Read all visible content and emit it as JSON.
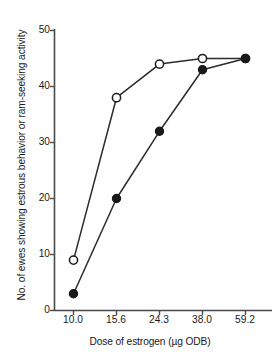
{
  "chart_data": {
    "type": "line",
    "title": "",
    "xlabel": "Dose of estrogen (µg ODB)",
    "ylabel": "No. of ewes showing estrous behavior or ram-seeking activity",
    "categories": [
      "10.0",
      "15.6",
      "24.3",
      "38.0",
      "59.2"
    ],
    "x_tick_labels": [
      "10.0",
      "15.6",
      "24.3",
      "38.0",
      "59.2"
    ],
    "y_tick_labels": [
      "0",
      "10",
      "20",
      "30",
      "40",
      "50"
    ],
    "y_ticks": [
      0,
      10,
      20,
      30,
      40,
      50
    ],
    "ylim": [
      0,
      50
    ],
    "grid": false,
    "legend": "none",
    "series": [
      {
        "name": "open-circle-series",
        "marker": "open-circle",
        "color": "#1a1a1a",
        "values": [
          9,
          38,
          44,
          45,
          45
        ]
      },
      {
        "name": "filled-circle-series",
        "marker": "filled-circle",
        "color": "#1a1a1a",
        "values": [
          3,
          20,
          32,
          43,
          45
        ]
      }
    ]
  },
  "axes": {
    "x_title": "Dose of estrogen (µg ODB)",
    "y_title": "No. of ewes showing estrous behavior or ram-seeking activity",
    "y_labels": [
      "50",
      "40",
      "30",
      "20",
      "10",
      "0"
    ],
    "x_labels": [
      "10.0",
      "15.6",
      "24.3",
      "38.0",
      "59.2"
    ]
  },
  "colors": {
    "axis": "#4a4a4a",
    "line": "#2b2b2b",
    "marker_fill": "#1a1a1a",
    "marker_open_fill": "#ffffff",
    "text": "#1a1a1a",
    "background": "#ffffff"
  }
}
